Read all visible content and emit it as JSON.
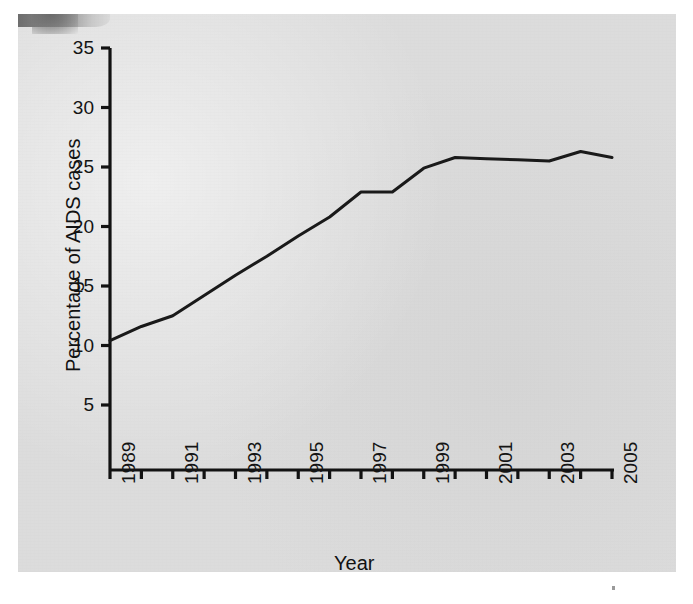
{
  "chart_data": {
    "type": "line",
    "title": "",
    "xlabel": "Year",
    "ylabel": "Percentage of AIDS cases",
    "x": [
      1989,
      1990,
      1991,
      1992,
      1993,
      1994,
      1995,
      1996,
      1997,
      1998,
      1999,
      2000,
      2001,
      2002,
      2003,
      2004,
      2005
    ],
    "series": [
      {
        "name": "Percentage of AIDS cases",
        "values": [
          10.4,
          11.6,
          12.5,
          14.2,
          15.9,
          17.5,
          19.2,
          20.8,
          22.9,
          22.9,
          24.9,
          25.8,
          25.7,
          25.6,
          25.5,
          26.3,
          25.8
        ]
      }
    ],
    "xlim": [
      1989,
      2005
    ],
    "ylim": [
      0,
      35
    ],
    "y_ticks": [
      5,
      10,
      15,
      20,
      25,
      30,
      35
    ],
    "y_tick_labels": [
      "5",
      "10",
      "15",
      "20",
      "25",
      "30",
      "35"
    ],
    "x_ticks": [
      1989,
      1990,
      1991,
      1992,
      1993,
      1994,
      1995,
      1996,
      1997,
      1998,
      1999,
      2000,
      2001,
      2002,
      2003,
      2004,
      2005
    ],
    "x_tick_labels": [
      "1989",
      "",
      "1991",
      "",
      "1993",
      "",
      "1995",
      "",
      "1997",
      "",
      "1999",
      "",
      "2001",
      "",
      "2003",
      "",
      "2005"
    ],
    "x_tick_labels_shown": [
      "1989",
      "1991",
      "1993",
      "1995",
      "1997",
      "1999",
      "2001",
      "2003",
      "2005"
    ],
    "grid": false,
    "legend": false,
    "legend_position": "none",
    "line_color": "#1a1a1a",
    "line_width": 3,
    "markers": false,
    "background_color": "#dcdcdc",
    "axis_color": "#121212"
  },
  "axes": {
    "y_title": "Percentage of AIDS cases",
    "x_title": "Year"
  }
}
